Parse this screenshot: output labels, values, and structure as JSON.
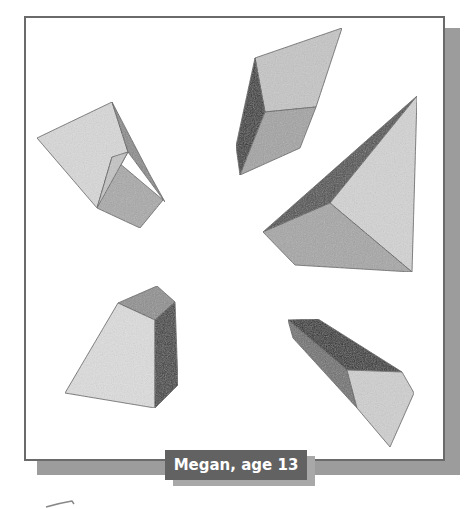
{
  "caption": {
    "text": "Megan, age 13"
  },
  "artwork": {
    "description": "Pencil drawing of five geometric solids",
    "shapes": [
      {
        "name": "folded-prism",
        "position": "top-left"
      },
      {
        "name": "triangular-prism",
        "position": "top-center"
      },
      {
        "name": "pyramid",
        "position": "right"
      },
      {
        "name": "frustum",
        "position": "bottom-left"
      },
      {
        "name": "pentagonal-prism",
        "position": "bottom-right"
      }
    ]
  },
  "colors": {
    "frame_border": "#6a6a6a",
    "frame_shadow": "#9c9c9c",
    "caption_bg": "#626262",
    "caption_text": "#ffffff"
  }
}
